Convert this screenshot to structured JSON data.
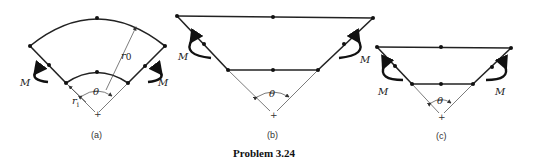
{
  "title": "Problem 3.24",
  "figures": [
    {
      "id": "a",
      "caption": "(a)",
      "shape": "curved beam (annular sector)",
      "labels": {
        "moment_left": "M",
        "moment_right": "M",
        "outer_radius": "r0",
        "outer_radius_main": "r",
        "outer_radius_sub": "0",
        "inner_radius_main": "r",
        "inner_radius_sub": "i",
        "angle": "θ",
        "center": "+"
      }
    },
    {
      "id": "b",
      "caption": "(b)",
      "shape": "trapezoidal frame (wide)",
      "labels": {
        "moment_left": "M",
        "moment_right": "M",
        "angle": "θ",
        "center": "+"
      }
    },
    {
      "id": "c",
      "caption": "(c)",
      "shape": "trapezoidal frame (narrow)",
      "labels": {
        "moment_left": "M",
        "moment_right": "M",
        "angle": "θ",
        "center": "+"
      }
    }
  ]
}
